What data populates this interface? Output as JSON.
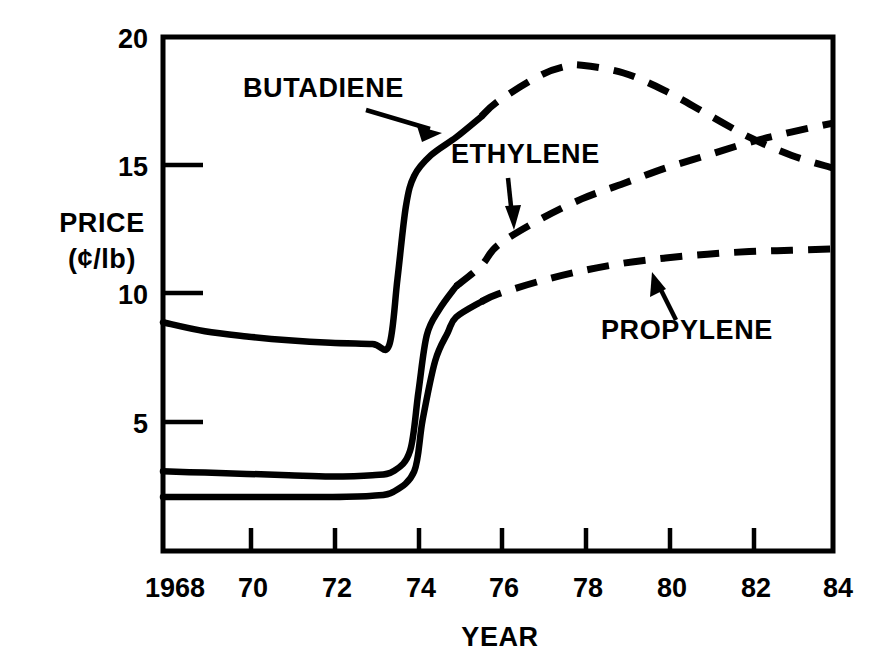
{
  "chart_data": {
    "type": "line",
    "title": "",
    "subtitle": "",
    "xlabel": "YEAR",
    "ylabel": "PRICE",
    "ylabel_units": "(¢/lb)",
    "xlim": [
      1968,
      1984
    ],
    "ylim": [
      0,
      20
    ],
    "x_ticks": [
      1968,
      1970,
      1972,
      1974,
      1976,
      1978,
      1980,
      1982,
      1984
    ],
    "x_tick_labels": [
      "1968",
      "70",
      "72",
      "74",
      "76",
      "78",
      "80",
      "82",
      "84"
    ],
    "y_ticks": [
      5,
      10,
      15,
      20
    ],
    "y_tick_labels": [
      "5",
      "10",
      "15",
      "20"
    ],
    "grid": false,
    "legend_position": "inline-annotations",
    "line_color": "#000000",
    "background_color": "#ffffff",
    "note_solid": "solid = historical (1968-1975)",
    "note_dashed": "dashed = forecast (1975-1984)",
    "series": [
      {
        "name": "BUTADIENE",
        "x": [
          1968,
          1969,
          1970,
          1971,
          1972,
          1973,
          1973.4,
          1973.6,
          1973.8,
          1974,
          1974.4,
          1975,
          1975.6,
          1976,
          1977,
          1977.6,
          1978,
          1979,
          1980,
          1981,
          1982,
          1983,
          1984
        ],
        "values": [
          8.9,
          8.55,
          8.35,
          8.2,
          8.1,
          8.05,
          8.0,
          10.6,
          13.4,
          14.6,
          15.4,
          16.1,
          16.9,
          17.5,
          18.5,
          18.85,
          18.9,
          18.6,
          17.9,
          17.0,
          16.1,
          15.4,
          14.9
        ],
        "solid_until": 1975.6
      },
      {
        "name": "ETHYLENE",
        "x": [
          1968,
          1969,
          1970,
          1971,
          1972,
          1973,
          1973.5,
          1973.9,
          1974.1,
          1974.3,
          1974.6,
          1975,
          1975.6,
          1976,
          1977,
          1978,
          1979,
          1980,
          1981,
          1982,
          1983,
          1984
        ],
        "values": [
          3.1,
          3.05,
          3.0,
          2.95,
          2.9,
          2.95,
          3.1,
          3.9,
          6.2,
          8.4,
          9.4,
          10.3,
          11.1,
          11.9,
          12.9,
          13.7,
          14.3,
          14.9,
          15.4,
          15.9,
          16.3,
          16.65
        ],
        "solid_until": 1975.3
      },
      {
        "name": "PROPYLENE",
        "x": [
          1968,
          1969,
          1970,
          1971,
          1972,
          1973,
          1973.5,
          1974,
          1974.2,
          1974.5,
          1974.8,
          1975,
          1975.6,
          1976,
          1977,
          1978,
          1979,
          1980,
          1981,
          1982,
          1983,
          1984
        ],
        "values": [
          2.1,
          2.1,
          2.1,
          2.1,
          2.1,
          2.15,
          2.3,
          3.1,
          5.1,
          7.4,
          8.5,
          9.1,
          9.7,
          10.0,
          10.5,
          10.9,
          11.2,
          11.4,
          11.55,
          11.65,
          11.7,
          11.75
        ],
        "solid_until": 1975.6
      }
    ],
    "annotations": [
      {
        "id": "butadiene-annotation",
        "text": "BUTADIENE",
        "label_x": 243,
        "label_y": 97,
        "arrow_from": [
          366,
          110
        ],
        "arrow_to": [
          437,
          131
        ]
      },
      {
        "id": "ethylene-annotation",
        "text": "ETHYLENE",
        "label_x": 451,
        "label_y": 163,
        "arrow_from": [
          508,
          178
        ],
        "arrow_to": [
          513,
          225
        ]
      },
      {
        "id": "propylene-annotation",
        "text": "PROPYLENE",
        "label_x": 601,
        "label_y": 339,
        "arrow_from": [
          675,
          319
        ],
        "arrow_to": [
          655,
          276
        ]
      }
    ]
  },
  "axes_geometry": {
    "left_px": 163,
    "right_px": 833,
    "top_px": 37,
    "bottom_px": 551
  }
}
